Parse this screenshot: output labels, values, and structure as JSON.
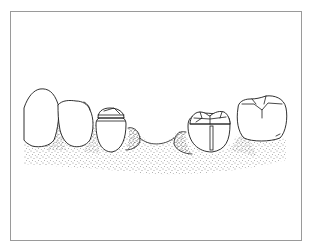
{
  "figure": {
    "frame_color": "#9a9a9a",
    "ink_color": "#1a1a1a",
    "stipple_color": "#333333",
    "elements": [
      {
        "id": "tooth-1",
        "label": "anterior tooth (partial, left edge)"
      },
      {
        "id": "tooth-2",
        "label": "canine / premolar crown"
      },
      {
        "id": "tooth-3",
        "label": "premolar with banded crown"
      },
      {
        "id": "edentulous-gap",
        "label": "edentulous ridge"
      },
      {
        "id": "tooth-4",
        "label": "molar with post/restoration"
      },
      {
        "id": "tooth-5",
        "label": "molar"
      }
    ]
  }
}
